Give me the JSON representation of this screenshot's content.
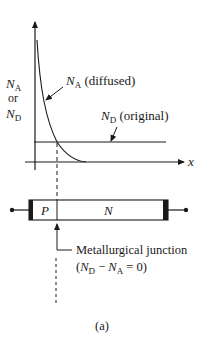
{
  "figure": {
    "caption": "(a)",
    "y_axis_label": {
      "line1_main": "N",
      "line1_sub": "A",
      "line2": "or",
      "line3_main": "N",
      "line3_sub": "D"
    },
    "x_axis_label": "x",
    "curve_label": {
      "main": "N",
      "sub": "A",
      "rest": " (diffused)"
    },
    "line_label": {
      "main": "N",
      "sub": "D",
      "rest": " (original)"
    },
    "device": {
      "p_region_label": "P",
      "n_region_label": "N"
    },
    "junction_label": {
      "line1": "Metallurgical junction",
      "line2_open": "(",
      "line2_nd_main": "N",
      "line2_nd_sub": "D",
      "line2_minus": " − ",
      "line2_na_main": "N",
      "line2_na_sub": "A",
      "line2_rest": " = 0)"
    },
    "colors": {
      "ink": "#1a1a1a",
      "background": "#ffffff"
    }
  }
}
